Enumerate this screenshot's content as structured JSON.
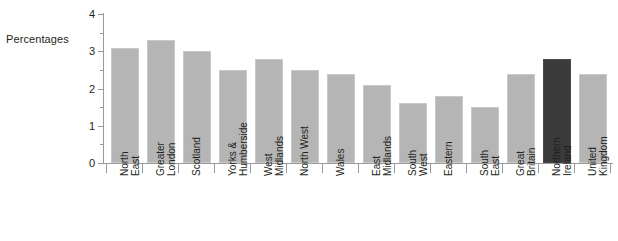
{
  "chart_data": {
    "type": "bar",
    "title": "",
    "xlabel": "",
    "ylabel": "Percentages",
    "ylim": [
      0,
      4
    ],
    "grid": false,
    "legend": "none",
    "y_ticks": [
      "0",
      "1",
      "2",
      "3",
      "4"
    ],
    "y_minor_ticks": [
      0.5,
      1.5,
      2.5,
      3.5
    ],
    "categories": [
      "North East",
      "Greater London",
      "Scotland",
      "Yorks & Humberside",
      "West Midlands",
      "North West",
      "Wales",
      "East Midlands",
      "South West",
      "Eastern",
      "South East",
      "Great Britain",
      "Northern Ireland",
      "United Kingdom"
    ],
    "category_lines": [
      [
        "North",
        "East"
      ],
      [
        "Greater",
        "London"
      ],
      [
        "Scotland",
        ""
      ],
      [
        "Yorks &",
        "Humberside"
      ],
      [
        "West",
        "Midlands"
      ],
      [
        "North West",
        ""
      ],
      [
        "Wales",
        ""
      ],
      [
        "East",
        "Midlands"
      ],
      [
        "South",
        "West"
      ],
      [
        "Eastern",
        ""
      ],
      [
        "South",
        "East"
      ],
      [
        "Great",
        "Britain"
      ],
      [
        "Northern",
        "Ireland"
      ],
      [
        "United",
        "Kingdom"
      ]
    ],
    "values": [
      3.1,
      3.3,
      3.0,
      2.5,
      2.8,
      2.5,
      2.4,
      2.1,
      1.6,
      1.8,
      1.5,
      2.4,
      2.8,
      2.4
    ],
    "highlight_index": 12,
    "colors": {
      "bar": "#b5b5b5",
      "bar_highlight": "#3a3a3a",
      "axis": "#9a9a9a",
      "text": "#231f20",
      "background": "#ffffff"
    }
  }
}
